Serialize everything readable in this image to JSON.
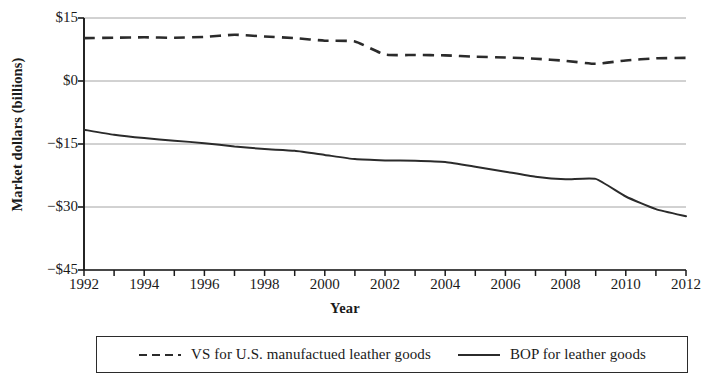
{
  "chart_data": {
    "type": "line",
    "title": "",
    "xlabel": "Year",
    "ylabel": "Market dollars (billions)",
    "xlim": [
      1992,
      2012
    ],
    "ylim": [
      -45,
      15
    ],
    "y_ticks": [
      15,
      0,
      -15,
      -30,
      -45
    ],
    "y_tick_labels": [
      "$15",
      "$0",
      "-$15",
      "-$30",
      "-$45"
    ],
    "x_ticks": [
      1992,
      1993,
      1994,
      1995,
      1996,
      1997,
      1998,
      1999,
      2000,
      2001,
      2002,
      2003,
      2004,
      2005,
      2006,
      2007,
      2008,
      2009,
      2010,
      2011,
      2012
    ],
    "x_tick_labels": [
      "1992",
      "1994",
      "1996",
      "1998",
      "2000",
      "2002",
      "2004",
      "2006",
      "2008",
      "2010",
      "2012"
    ],
    "x_labeled_ticks": [
      1992,
      1994,
      1996,
      1998,
      2000,
      2002,
      2004,
      2006,
      2008,
      2010,
      2012
    ],
    "grid": "horizontal",
    "legend_position": "below",
    "x": [
      1992,
      1993,
      1994,
      1995,
      1996,
      1997,
      1998,
      1999,
      2000,
      2001,
      2002,
      2003,
      2004,
      2005,
      2006,
      2007,
      2008,
      2009,
      2010,
      2011,
      2012
    ],
    "series": [
      {
        "name": "VS for U.S. manufactued leather goods",
        "style": "dashed",
        "color": "#2b2b2b",
        "values": [
          10.2,
          10.3,
          10.4,
          10.3,
          10.5,
          11.0,
          10.6,
          10.2,
          9.6,
          9.4,
          6.3,
          6.2,
          6.1,
          5.8,
          5.6,
          5.3,
          4.8,
          4.1,
          4.9,
          5.4,
          5.5
        ]
      },
      {
        "name": "BOP for leather goods",
        "style": "solid",
        "color": "#2b2b2b",
        "values": [
          -11.6,
          -12.8,
          -13.6,
          -14.2,
          -14.8,
          -15.6,
          -16.2,
          -16.6,
          -17.6,
          -18.6,
          -18.9,
          -19.0,
          -19.3,
          -20.4,
          -21.6,
          -22.8,
          -23.4,
          -23.3,
          -27.5,
          -30.5,
          -32.2
        ]
      }
    ]
  },
  "legend": {
    "entries": [
      {
        "label": "VS for U.S. manufactued leather goods",
        "style": "dashed"
      },
      {
        "label": "BOP for leather goods",
        "style": "solid"
      }
    ]
  },
  "colors": {
    "line": "#2b2b2b",
    "grid": "#9a9a9a",
    "axis": "#1a1a1a",
    "text": "#1a1a1a"
  }
}
